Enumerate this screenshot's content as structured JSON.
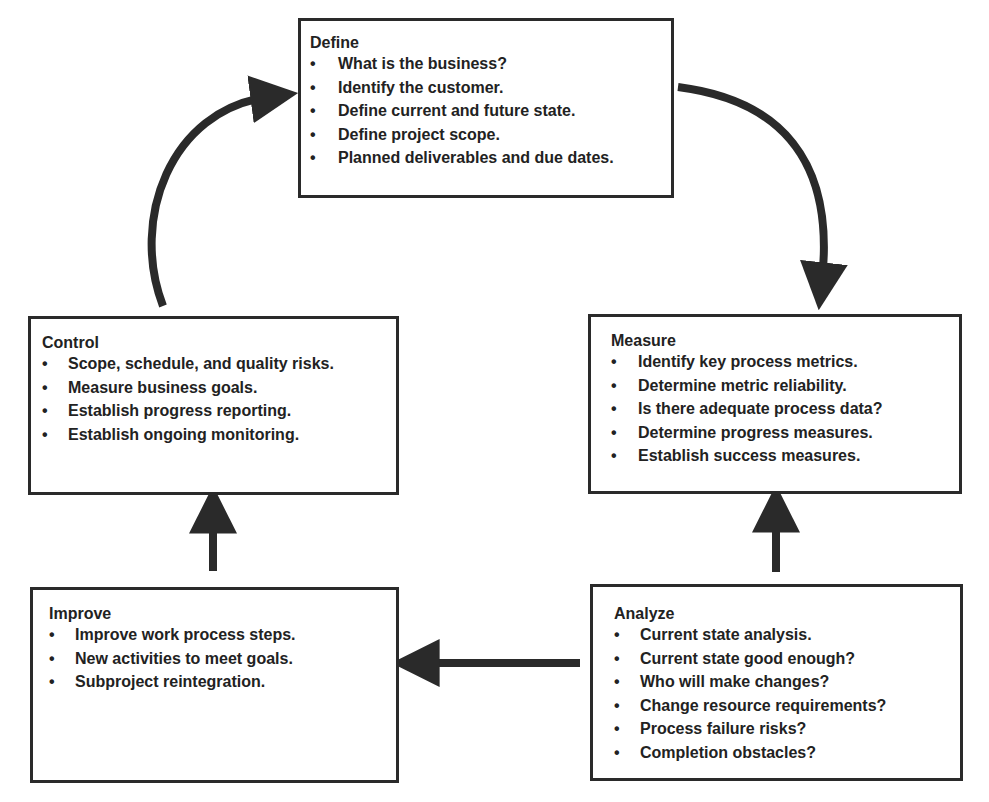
{
  "diagram": {
    "type": "DMAIC cycle",
    "colors": {
      "stroke": "#2a2a2a",
      "text": "#222222",
      "background": "#ffffff"
    },
    "boxes": {
      "define": {
        "title": "Define",
        "items": [
          "What is the business?",
          "Identify the customer.",
          "Define current and future state.",
          "Define project scope.",
          "Planned deliverables and due dates."
        ]
      },
      "measure": {
        "title": "Measure",
        "items": [
          "Identify key process metrics.",
          "Determine metric reliability.",
          "Is there adequate process data?",
          "Determine progress measures.",
          "Establish success measures."
        ]
      },
      "analyze": {
        "title": "Analyze",
        "items": [
          "Current state analysis.",
          "Current state good enough?",
          "Who will make changes?",
          "Change resource requirements?",
          "Process failure risks?",
          "Completion obstacles?"
        ]
      },
      "improve": {
        "title": "Improve",
        "items": [
          "Improve work process steps.",
          "New activities to meet goals.",
          "Subproject reintegration."
        ]
      },
      "control": {
        "title": "Control",
        "items": [
          "Scope, schedule, and quality risks.",
          "Measure business goals.",
          "Establish progress reporting.",
          "Establish ongoing monitoring."
        ]
      }
    },
    "bullet": "•",
    "flow": [
      "Define",
      "Measure",
      "Analyze",
      "Improve",
      "Control",
      "Define"
    ]
  }
}
